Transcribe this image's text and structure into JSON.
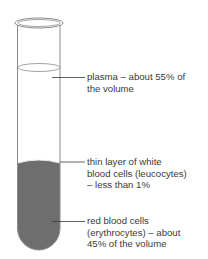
{
  "diagram": {
    "type": "test-tube-blood-composition",
    "colors": {
      "tube_outline": "#8a8a8a",
      "red_cells_fill": "#6e6e6e",
      "leader_line": "#3a3a3a",
      "text": "#3a3a3a"
    },
    "labels": [
      {
        "id": "plasma",
        "lines": [
          "plasma – about 55% of",
          "the volume"
        ]
      },
      {
        "id": "white-cells",
        "lines": [
          "thin layer of white",
          "blood cells (leucocytes)",
          "– less than 1%"
        ]
      },
      {
        "id": "red-cells",
        "lines": [
          "red blood cells",
          "(erythrocytes) – about",
          "45% of the volume"
        ]
      }
    ]
  }
}
